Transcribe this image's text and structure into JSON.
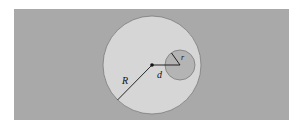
{
  "diagram": {
    "colors": {
      "page_background": "#ffffff",
      "field_background": "#a9a9a9",
      "large_disk_fill": "#d6d6d6",
      "large_disk_stroke": "#7a7a7a",
      "small_disk_fill": "#b4b4b4",
      "small_disk_stroke": "#7a7a7a",
      "line_color": "#111111"
    },
    "labels": {
      "big_radius": "R",
      "offset": "d",
      "small_radius": "r"
    },
    "geometry": {
      "field": {
        "x": 14,
        "y": 9,
        "w": 275,
        "h": 111
      },
      "large_circle": {
        "cx": 152,
        "cy": 65,
        "r": 49
      },
      "small_circle": {
        "cx": 180,
        "cy": 65,
        "r": 15
      },
      "center_dot": {
        "cx": 152,
        "cy": 65,
        "r": 1.8
      }
    }
  }
}
